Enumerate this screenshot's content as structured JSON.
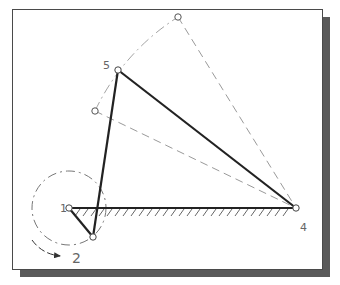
{
  "figure": {
    "type": "four-bar linkage mechanism diagram",
    "colors": {
      "link": "#222222",
      "construction": "#9a9a9a",
      "frame_border": "#4a4a4a",
      "shadow": "#5a5a5a",
      "label": "#666666"
    },
    "joints": [
      {
        "id": "1",
        "label": "1",
        "x": 69,
        "y": 208,
        "label_x": 60,
        "label_y": 212
      },
      {
        "id": "2",
        "label": "",
        "x": 93,
        "y": 237
      },
      {
        "id": "4",
        "label": "4",
        "x": 296,
        "y": 208,
        "label_x": 300,
        "label_y": 230
      },
      {
        "id": "5",
        "label": "5",
        "x": 118,
        "y": 70,
        "label_x": 103,
        "label_y": 69
      },
      {
        "id": "p_low",
        "label": "",
        "x": 95,
        "y": 111
      },
      {
        "id": "p_top",
        "label": "",
        "x": 178,
        "y": 17
      }
    ],
    "links": [
      {
        "name": "crank",
        "from": "1",
        "to": "2"
      },
      {
        "name": "coupler",
        "from": "2",
        "to": "5"
      },
      {
        "name": "rocker",
        "from": "5",
        "to": "4"
      },
      {
        "name": "ground",
        "from": "1",
        "to": "4"
      }
    ],
    "construction_lines": [
      {
        "name": "rocker-extreme-upper",
        "from": "p_top",
        "to": "4"
      },
      {
        "name": "rocker-extreme-lower",
        "from": "p_low",
        "to": "4"
      }
    ],
    "crank_circle": {
      "center": "1",
      "radius": 37
    },
    "rotation_label": "2",
    "rotation_label_pos": {
      "x": 72,
      "y": 262
    }
  }
}
